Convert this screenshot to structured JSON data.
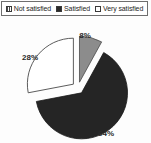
{
  "legend": {
    "entries": [
      {
        "label": "Not satisfied",
        "marker": "hatched-square-icon",
        "color": "#7a7a7a"
      },
      {
        "label": "Satisfied",
        "marker": "filled-square-icon",
        "color": "#2b2b2b"
      },
      {
        "label": "Very satisfied",
        "marker": "empty-square-icon",
        "color": "#ffffff"
      }
    ]
  },
  "chart_data": {
    "type": "pie",
    "title": "",
    "categories": [
      "Not satisfied",
      "Satisfied",
      "Very satisfied"
    ],
    "values": [
      8,
      64,
      28
    ],
    "labels": [
      "8%",
      "64%",
      "28%"
    ],
    "colors": [
      "#8c8c8c",
      "#252525",
      "#ffffff"
    ],
    "exploded": true,
    "legend_position": "top",
    "grid": false,
    "unit": "percent"
  }
}
